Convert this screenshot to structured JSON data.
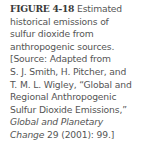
{
  "figure": {
    "label": "FIGURE 4-18",
    "lines": {
      "l1_rest": " Estimated",
      "l2": "historical emissions of",
      "l3": "sulfur dioxide from",
      "l4": "anthropogenic sources.",
      "l5": "[Source: Adapted from",
      "l6": "S. J. Smith, H. Pitcher, and",
      "l7": "T. M. L. Wigley, “Global and",
      "l8": "Regional Anthropogenic",
      "l9": "Sulfur Dioxide Emissions,”",
      "l10_italic": "Global and Planetary",
      "l11_italic": "Change",
      "l11_rest": " 29 (2001): 99.]"
    }
  }
}
